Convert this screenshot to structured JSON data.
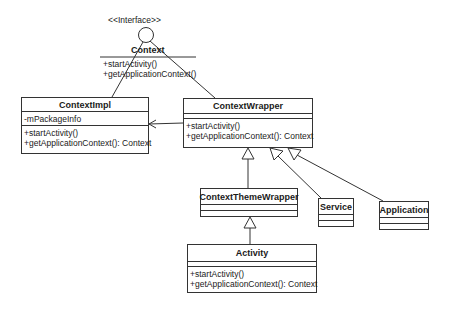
{
  "interface": {
    "stereotype": "<<Interface>>",
    "name": "Context",
    "methods": [
      "+startActivity()",
      "+getApplicationContext()"
    ]
  },
  "classes": {
    "contextimpl": {
      "name": "ContextImpl",
      "attributes": [
        "-mPackageInfo"
      ],
      "methods": [
        "+startActivity()",
        "+getApplicationContext(): Context"
      ]
    },
    "contextwrapper": {
      "name": "ContextWrapper",
      "attributes": [],
      "methods": [
        "+startActivity()",
        "+getApplicationContext(): Context"
      ]
    },
    "contextthemewrapper": {
      "name": "ContextThemeWrapper",
      "attributes": [],
      "methods": []
    },
    "service": {
      "name": "Service",
      "attributes": [],
      "methods": []
    },
    "application": {
      "name": "Application",
      "attributes": [],
      "methods": []
    },
    "activity": {
      "name": "Activity",
      "attributes": [],
      "methods": [
        "+startActivity()",
        "+getApplicationContext(): Context"
      ]
    }
  },
  "relations": [
    {
      "from": "ContextImpl",
      "to": "Context",
      "type": "realization"
    },
    {
      "from": "ContextWrapper",
      "to": "Context",
      "type": "realization"
    },
    {
      "from": "ContextWrapper",
      "to": "ContextImpl",
      "type": "association"
    },
    {
      "from": "ContextThemeWrapper",
      "to": "ContextWrapper",
      "type": "generalization"
    },
    {
      "from": "Service",
      "to": "ContextWrapper",
      "type": "generalization"
    },
    {
      "from": "Application",
      "to": "ContextWrapper",
      "type": "generalization"
    },
    {
      "from": "Activity",
      "to": "ContextThemeWrapper",
      "type": "generalization"
    }
  ]
}
